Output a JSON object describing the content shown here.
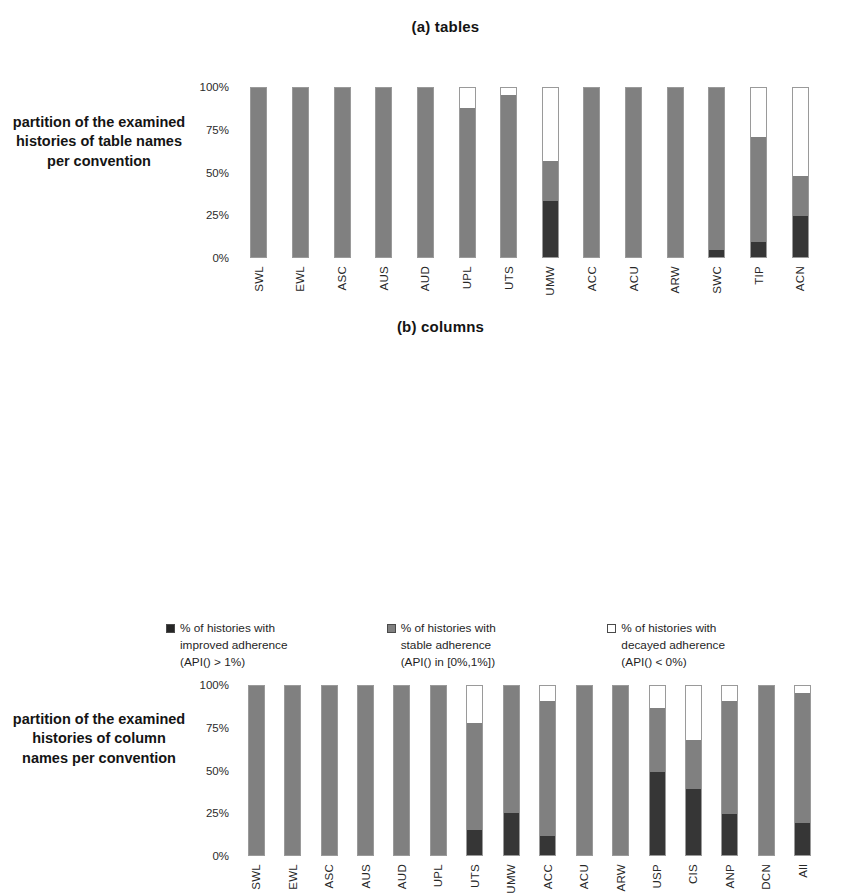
{
  "figure": {
    "background": "#ffffff"
  },
  "colors": {
    "improved": "#363636",
    "stable": "#808080",
    "decayed": "#ffffff",
    "bar_border": "#9a9a9a",
    "text": "#1a1a1a"
  },
  "panels": {
    "a": {
      "title": "(a)  tables",
      "caption": "partition of the examined histories of table names per convention"
    },
    "b": {
      "title": "(b)  columns",
      "caption": "partition of the examined histories of column names per convention"
    }
  },
  "legend": {
    "items": [
      {
        "swatch": "improved",
        "line1": "% of histories with",
        "line2": "improved adherence",
        "line3": "(API() > 1%)"
      },
      {
        "swatch": "stable",
        "line1": "% of histories with",
        "line2": "stable adherence",
        "line3": "(API() in [0%,1%])"
      },
      {
        "swatch": "decayed",
        "line1": "% of histories with",
        "line2": "decayed adherence",
        "line3": "(API() < 0%)"
      }
    ]
  },
  "chart_data": [
    {
      "id": "a",
      "type": "bar",
      "stacked": true,
      "percent": true,
      "title": "(a)  tables",
      "xlabel": "",
      "ylabel": "partition of the examined histories of table names per convention",
      "ylim": [
        0,
        100
      ],
      "yticks": [
        "0%",
        "25%",
        "50%",
        "75%",
        "100%"
      ],
      "ytick_values": [
        0,
        25,
        50,
        75,
        100
      ],
      "grid": false,
      "legend_position": "bottom",
      "categories": [
        "SWL",
        "EWL",
        "ASC",
        "AUS",
        "AUD",
        "UPL",
        "UTS",
        "UMW",
        "ACC",
        "ACU",
        "ARW",
        "SWC",
        "TIP",
        "ACN"
      ],
      "series": [
        {
          "name": "% of histories with improved adherence (API() > 1%)",
          "key": "improved",
          "color": "#363636",
          "values": [
            0,
            0,
            0,
            0,
            0,
            0,
            0,
            33,
            0,
            0,
            0,
            4,
            9,
            24
          ]
        },
        {
          "name": "% of histories with stable adherence (API() in [0%,1%])",
          "key": "stable",
          "color": "#808080",
          "values": [
            100,
            100,
            100,
            100,
            100,
            88,
            96,
            24,
            100,
            100,
            100,
            96,
            62,
            24
          ]
        },
        {
          "name": "% of histories with decayed adherence (API() < 0%)",
          "key": "decayed",
          "color": "#ffffff",
          "values": [
            0,
            0,
            0,
            0,
            0,
            12,
            4,
            43,
            0,
            0,
            0,
            0,
            29,
            52
          ]
        }
      ]
    },
    {
      "id": "b",
      "type": "bar",
      "stacked": true,
      "percent": true,
      "title": "(b)  columns",
      "xlabel": "",
      "ylabel": "partition of the examined histories of column names per convention",
      "ylim": [
        0,
        100
      ],
      "yticks": [
        "0%",
        "25%",
        "50%",
        "75%",
        "100%"
      ],
      "ytick_values": [
        0,
        25,
        50,
        75,
        100
      ],
      "grid": false,
      "legend_position": "bottom",
      "categories": [
        "SWL",
        "EWL",
        "ASC",
        "AUS",
        "AUD",
        "UPL",
        "UTS",
        "UMW",
        "ACC",
        "ACU",
        "ARW",
        "USP",
        "CIS",
        "ANP",
        "DCN",
        "All"
      ],
      "series": [
        {
          "name": "% of histories with improved adherence (API() > 1%)",
          "key": "improved",
          "color": "#363636",
          "values": [
            0,
            0,
            0,
            0,
            0,
            0,
            15,
            25,
            11,
            0,
            0,
            49,
            39,
            24,
            0,
            19
          ]
        },
        {
          "name": "% of histories with stable adherence (API() in [0%,1%])",
          "key": "stable",
          "color": "#808080",
          "values": [
            100,
            100,
            100,
            100,
            100,
            100,
            63,
            75,
            80,
            100,
            100,
            38,
            29,
            67,
            100,
            77
          ]
        },
        {
          "name": "% of histories with decayed adherence (API() < 0%)",
          "key": "decayed",
          "color": "#ffffff",
          "values": [
            0,
            0,
            0,
            0,
            0,
            0,
            22,
            0,
            9,
            0,
            0,
            13,
            32,
            9,
            0,
            4
          ]
        }
      ]
    }
  ]
}
